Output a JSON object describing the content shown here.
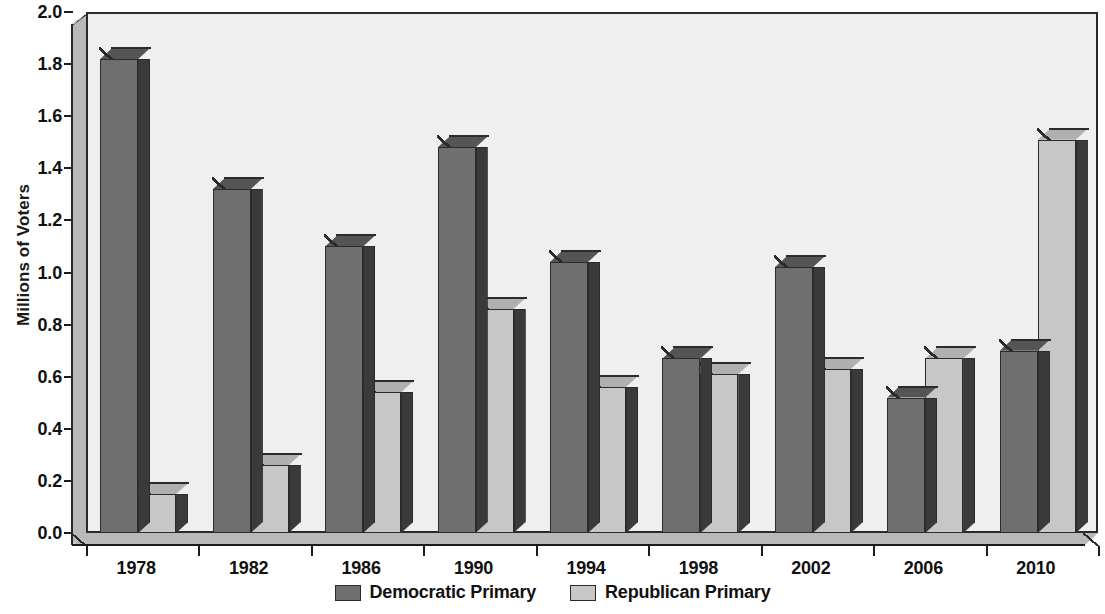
{
  "chart_data": {
    "type": "bar",
    "title": "",
    "xlabel": "",
    "ylabel": "Millions of Voters",
    "categories": [
      "1978",
      "1982",
      "1986",
      "1990",
      "1994",
      "1998",
      "2002",
      "2006",
      "2010"
    ],
    "series": [
      {
        "name": "Democratic Primary",
        "color": "#6f6f6f",
        "values": [
          1.82,
          1.32,
          1.1,
          1.48,
          1.04,
          0.67,
          1.02,
          0.52,
          0.7
        ]
      },
      {
        "name": "Republican Primary",
        "color": "#c7c7c7",
        "values": [
          0.15,
          0.26,
          0.54,
          0.86,
          0.56,
          0.61,
          0.63,
          0.67,
          1.51
        ]
      }
    ],
    "ylim": [
      0.0,
      2.0
    ],
    "ytick_labels": [
      "0.0",
      "0.2",
      "0.4",
      "0.6",
      "0.8",
      "1.0",
      "1.2",
      "1.4",
      "1.6",
      "1.8",
      "2.0"
    ],
    "ytick_values": [
      0.0,
      0.2,
      0.4,
      0.6,
      0.8,
      1.0,
      1.2,
      1.4,
      1.6,
      1.8,
      2.0
    ],
    "grid": false,
    "legend_position": "bottom",
    "style": "3d-grouped-bars"
  }
}
